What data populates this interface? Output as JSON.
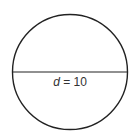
{
  "diagram": {
    "shape": "circle",
    "stroke_color": "#222222",
    "background": "#ffffff",
    "diameter_label": {
      "variable": "d",
      "equals": " = ",
      "value": "10"
    }
  }
}
